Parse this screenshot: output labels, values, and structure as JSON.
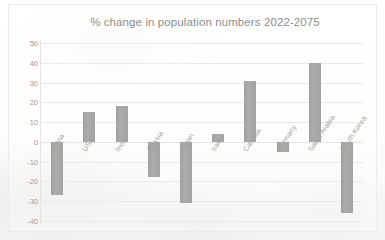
{
  "chart_data": {
    "type": "bar",
    "title": "% change in population numbers 2022-2075",
    "xlabel": "",
    "ylabel": "",
    "ylim": [
      -40,
      50
    ],
    "yticks": [
      50,
      40,
      30,
      20,
      10,
      0,
      -10,
      -20,
      -30,
      -40
    ],
    "ytick_labels": [
      "50",
      "40",
      "30",
      "20",
      "10",
      "0",
      "-10",
      "-20",
      "-30",
      "-40"
    ],
    "grid": true,
    "legend": false,
    "categories": [
      "China",
      "USA",
      "India",
      "Russia",
      "Japan",
      "Iran",
      "Canada",
      "Germany",
      "Saudi Arabia",
      "South Korea"
    ],
    "values": [
      -27,
      15,
      18,
      -18,
      -31,
      4,
      31,
      -5,
      40,
      -36
    ],
    "bar_color": "#a6a6a6",
    "text_color": "#9c9c9a",
    "grid_color": "#e9e9e7",
    "background_color": "#fdfdfc"
  }
}
